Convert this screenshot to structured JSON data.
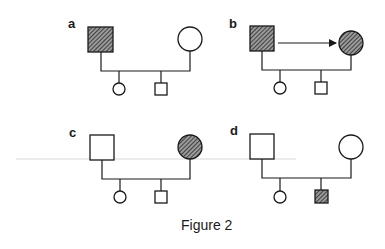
{
  "caption": "Figure 2",
  "colors": {
    "ink": "#1a1a1a",
    "hatch_dark": "#2a2a2a",
    "hatch_light": "#9a9a9a",
    "background": "#ffffff",
    "guide_line": "#d8d8d8"
  },
  "legend_semantics": {
    "square": "male",
    "circle": "female",
    "hatched": "affected",
    "open": "unaffected",
    "arrow": "transmission from father to mother"
  },
  "panels": [
    {
      "label": "a",
      "parents": [
        {
          "sex": "male",
          "affected": true
        },
        {
          "sex": "female",
          "affected": false
        }
      ],
      "children": [
        {
          "sex": "female",
          "affected": false
        },
        {
          "sex": "male",
          "affected": false
        }
      ],
      "arrow": false
    },
    {
      "label": "b",
      "parents": [
        {
          "sex": "male",
          "affected": true
        },
        {
          "sex": "female",
          "affected": true
        }
      ],
      "children": [
        {
          "sex": "female",
          "affected": false
        },
        {
          "sex": "male",
          "affected": false
        }
      ],
      "arrow": true
    },
    {
      "label": "c",
      "parents": [
        {
          "sex": "male",
          "affected": false
        },
        {
          "sex": "female",
          "affected": true
        }
      ],
      "children": [
        {
          "sex": "female",
          "affected": false
        },
        {
          "sex": "male",
          "affected": false
        }
      ],
      "arrow": false
    },
    {
      "label": "d",
      "parents": [
        {
          "sex": "male",
          "affected": false
        },
        {
          "sex": "female",
          "affected": false
        }
      ],
      "children": [
        {
          "sex": "female",
          "affected": false
        },
        {
          "sex": "male",
          "affected": true
        }
      ],
      "arrow": false
    }
  ]
}
